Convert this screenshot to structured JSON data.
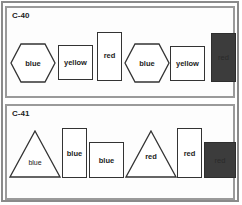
{
  "panels": [
    {
      "title": "C-40",
      "shapes": [
        {
          "type": "hexagon",
          "label": "blue"
        },
        {
          "type": "square",
          "label": "yellow"
        },
        {
          "type": "tall-rectangle",
          "label": "red"
        },
        {
          "type": "hexagon",
          "label": "blue"
        },
        {
          "type": "square",
          "label": "yellow"
        },
        {
          "type": "filled-tall-rectangle",
          "label": "red",
          "fill": "#3c3c3c"
        }
      ]
    },
    {
      "title": "C-41",
      "shapes": [
        {
          "type": "triangle",
          "label": "blue"
        },
        {
          "type": "tall-rectangle",
          "label": "blue"
        },
        {
          "type": "square",
          "label": "blue"
        },
        {
          "type": "triangle",
          "label": "red"
        },
        {
          "type": "tall-rectangle",
          "label": "red"
        },
        {
          "type": "filled-square",
          "label": "red",
          "fill": "#3c3c3c"
        }
      ]
    }
  ]
}
